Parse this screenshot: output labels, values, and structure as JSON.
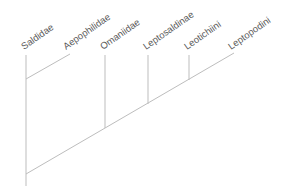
{
  "diagram": {
    "type": "cladogram",
    "colors": {
      "branch": "#bdbdbd",
      "label": "#5a5a5a",
      "background": "#ffffff"
    },
    "taxa": [
      {
        "id": "saldidae",
        "label": "Saldidae"
      },
      {
        "id": "aepophilidae",
        "label": "Aepophilidae"
      },
      {
        "id": "omaniidae",
        "label": "Omaniidae"
      },
      {
        "id": "leptosaldinae",
        "label": "Leptosaldinae"
      },
      {
        "id": "leotichiini",
        "label": "Leotichiini"
      },
      {
        "id": "leptopodini",
        "label": "Leptopodini"
      }
    ],
    "topology": "((Saldidae,Aepophilidae),(Omaniidae,(Leptosaldinae,(Leotichiini,Leptopodini))))"
  }
}
